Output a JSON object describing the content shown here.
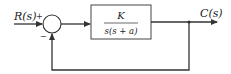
{
  "diagram": {
    "type": "feedback-control-block-diagram",
    "input_label": "R(s)",
    "output_label": "C(s)",
    "summing_junction": {
      "plus_sign": "+",
      "minus_sign": "−"
    },
    "block": {
      "numerator": "K",
      "denominator": "s(s + a)"
    },
    "feedback": "unity negative feedback",
    "colors": {
      "line": "#333333",
      "background": "#ffffff"
    }
  }
}
